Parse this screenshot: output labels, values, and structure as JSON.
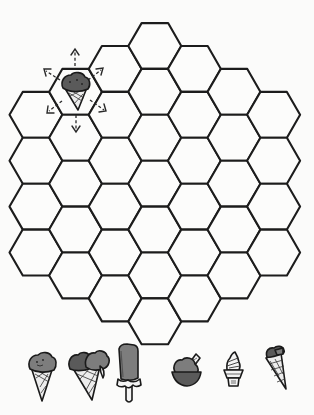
{
  "board": {
    "shape": "hexagonal board of flat-topped hex cells",
    "columns": [
      {
        "index": 0,
        "cells": 4
      },
      {
        "index": 1,
        "cells": 5
      },
      {
        "index": 2,
        "cells": 6
      },
      {
        "index": 3,
        "cells": 7
      },
      {
        "index": 4,
        "cells": 6
      },
      {
        "index": 5,
        "cells": 5
      },
      {
        "index": 6,
        "cells": 4
      }
    ],
    "total_cells": 37,
    "stroke_color": "#1c1c1c",
    "fill_color": "#fcfcfb",
    "occupied_cell": {
      "column": 1,
      "row": 0,
      "piece": "ice-cream-cone",
      "move_arrows": [
        "up",
        "up-right",
        "down-right",
        "down",
        "down-left",
        "up-left"
      ]
    }
  },
  "pieces_tray": {
    "items": [
      {
        "name": "single-scoop-cone"
      },
      {
        "name": "double-scoop-cone"
      },
      {
        "name": "chocolate-dipped-popsicle"
      },
      {
        "name": "sundae-bowl-with-wafer"
      },
      {
        "name": "soft-serve-cup"
      },
      {
        "name": "tilted-cone"
      }
    ]
  },
  "labels": {
    "board": "Hex game board",
    "tray": "Ice cream pieces"
  }
}
